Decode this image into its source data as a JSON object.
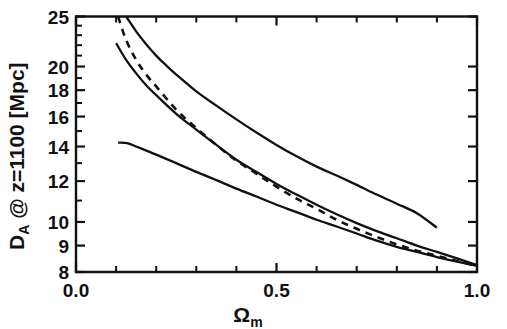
{
  "chart_data": {
    "type": "line",
    "title": "",
    "xlabel": "Ω",
    "xlabel_sub": "m",
    "ylabel": "D",
    "ylabel_sub": "A",
    "ylabel_rest": " @ z=1100 [Mpc]",
    "ylabel_full": "D_A @ z=1100 [Mpc]",
    "xscale": "linear",
    "yscale": "log",
    "xlim": [
      0.0,
      1.0
    ],
    "ylim": [
      8,
      25
    ],
    "grid": false,
    "legend": "none",
    "xticks": [
      0.0,
      0.1,
      0.2,
      0.3,
      0.4,
      0.5,
      0.6,
      0.7,
      0.8,
      0.9,
      1.0
    ],
    "xticklabels": [
      "0.0",
      "",
      "",
      "",
      "",
      "0.5",
      "",
      "",
      "",
      "",
      "1.0"
    ],
    "xticklabels_shown": [
      "0.0",
      "0.5",
      "1.0"
    ],
    "yticks": [
      8,
      9,
      10,
      12,
      14,
      16,
      18,
      20,
      25
    ],
    "yticklabels": [
      "8",
      "9",
      "10",
      "12",
      "14",
      "16",
      "18",
      "20",
      "25"
    ],
    "series": [
      {
        "name": "upper-solid",
        "style": "solid",
        "x": [
          0.125,
          0.15,
          0.175,
          0.2,
          0.225,
          0.25,
          0.3,
          0.35,
          0.4,
          0.45,
          0.5,
          0.55,
          0.6,
          0.65,
          0.7,
          0.75,
          0.8,
          0.85,
          0.9
        ],
        "y": [
          25.0,
          23.4,
          22.1,
          21.0,
          20.1,
          19.3,
          17.9,
          16.8,
          15.8,
          14.9,
          14.1,
          13.4,
          12.8,
          12.3,
          11.8,
          11.3,
          10.85,
          10.4,
          9.75
        ]
      },
      {
        "name": "middle-solid",
        "style": "solid",
        "x": [
          0.1,
          0.125,
          0.15,
          0.175,
          0.2,
          0.25,
          0.3,
          0.35,
          0.4,
          0.45,
          0.5,
          0.55,
          0.6,
          0.65,
          0.7,
          0.75,
          0.8,
          0.85,
          0.9,
          0.95,
          1.0
        ],
        "y": [
          22.2,
          20.6,
          19.4,
          18.4,
          17.6,
          16.2,
          15.1,
          14.1,
          13.2,
          12.5,
          11.85,
          11.3,
          10.8,
          10.35,
          9.95,
          9.6,
          9.3,
          9.0,
          8.75,
          8.5,
          8.25
        ]
      },
      {
        "name": "dashed",
        "style": "dashed",
        "x": [
          0.105,
          0.125,
          0.15,
          0.175,
          0.2,
          0.25,
          0.3,
          0.35,
          0.4,
          0.45,
          0.5,
          0.55,
          0.6,
          0.65,
          0.7,
          0.75,
          0.8,
          0.85,
          0.9,
          0.95,
          1.0
        ],
        "y": [
          25.0,
          22.5,
          20.6,
          19.3,
          18.3,
          16.5,
          15.2,
          14.1,
          13.15,
          12.4,
          11.7,
          11.1,
          10.6,
          10.1,
          9.7,
          9.35,
          9.05,
          8.8,
          8.6,
          8.4,
          8.22
        ]
      },
      {
        "name": "lower-solid",
        "style": "solid",
        "x": [
          0.105,
          0.13,
          0.15,
          0.18,
          0.2,
          0.25,
          0.3,
          0.35,
          0.4,
          0.45,
          0.5,
          0.55,
          0.6,
          0.65,
          0.7,
          0.75,
          0.8,
          0.85,
          0.9,
          0.95,
          1.0
        ],
        "y": [
          14.25,
          14.2,
          14.0,
          13.7,
          13.5,
          13.0,
          12.5,
          12.05,
          11.6,
          11.2,
          10.8,
          10.45,
          10.1,
          9.8,
          9.5,
          9.2,
          8.95,
          8.75,
          8.55,
          8.38,
          8.22
        ]
      }
    ]
  }
}
